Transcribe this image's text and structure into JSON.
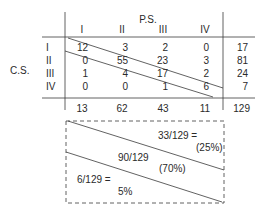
{
  "table": {
    "col_group_label": "P.S.",
    "row_group_label": "C.S.",
    "col_headers": [
      "I",
      "II",
      "III",
      "IV"
    ],
    "row_headers": [
      "I",
      "II",
      "III",
      "IV"
    ],
    "cells": [
      [
        "12",
        "3",
        "2",
        "0"
      ],
      [
        "0",
        "55",
        "23",
        "3"
      ],
      [
        "1",
        "4",
        "17",
        "2"
      ],
      [
        "0",
        "0",
        "1",
        "6"
      ]
    ],
    "row_totals": [
      "17",
      "81",
      "24",
      "7"
    ],
    "col_totals": [
      "13",
      "62",
      "43",
      "11"
    ],
    "grand_total": "129"
  },
  "summary_box": {
    "upper_fraction": "33/129 =",
    "upper_percent": "(25%)",
    "middle_fraction": "90/129",
    "middle_percent": "(70%)",
    "lower_fraction": "6/129 =",
    "lower_percent": "5%"
  },
  "colors": {
    "line": "#3a3a3a",
    "text": "#2a2a2a"
  }
}
